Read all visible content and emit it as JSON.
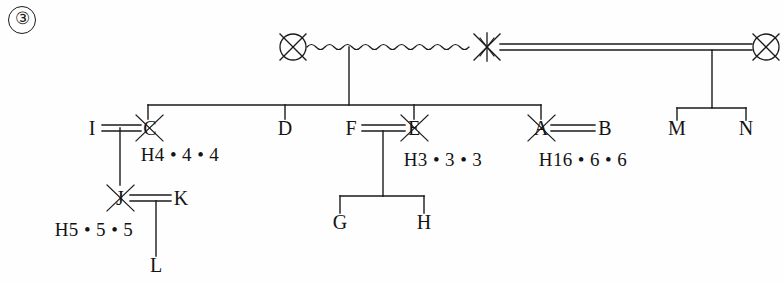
{
  "figure": {
    "number": "③",
    "caption_number": "3",
    "background_color": "#fefefe",
    "line_color": "#1a1a1a",
    "text_color": "#141414",
    "width": 783,
    "height": 283
  },
  "persons": [
    {
      "id": "p-top-left",
      "label": "",
      "x": 293,
      "y": 47,
      "symbol": "circle-crossed",
      "deceased": true,
      "label_dx": 0,
      "label_dy": 0
    },
    {
      "id": "p-top-mid",
      "label": "",
      "x": 487,
      "y": 47,
      "symbol": "cross-only",
      "deceased": true,
      "label_dx": 0,
      "label_dy": 0
    },
    {
      "id": "p-top-right",
      "label": "",
      "x": 766,
      "y": 47,
      "symbol": "circle-crossed",
      "deceased": true,
      "label_dx": 0,
      "label_dy": 0
    },
    {
      "id": "p-I",
      "label": "I",
      "x": 92,
      "y": 128,
      "symbol": "text",
      "deceased": false
    },
    {
      "id": "p-C",
      "label": "C",
      "x": 150,
      "y": 128,
      "symbol": "text-crossed",
      "deceased": true
    },
    {
      "id": "p-D",
      "label": "D",
      "x": 285,
      "y": 128,
      "symbol": "text",
      "deceased": false
    },
    {
      "id": "p-F",
      "label": "F",
      "x": 351,
      "y": 128,
      "symbol": "text",
      "deceased": false
    },
    {
      "id": "p-E",
      "label": "E",
      "x": 414,
      "y": 128,
      "symbol": "text-crossed",
      "deceased": true
    },
    {
      "id": "p-A",
      "label": "A",
      "x": 541,
      "y": 128,
      "symbol": "text-crossed",
      "deceased": true
    },
    {
      "id": "p-B",
      "label": "B",
      "x": 605,
      "y": 128,
      "symbol": "text",
      "deceased": false
    },
    {
      "id": "p-M",
      "label": "M",
      "x": 677,
      "y": 128,
      "symbol": "text",
      "deceased": false
    },
    {
      "id": "p-N",
      "label": "N",
      "x": 746,
      "y": 128,
      "symbol": "text",
      "deceased": false
    },
    {
      "id": "p-J",
      "label": "J",
      "x": 120,
      "y": 198,
      "symbol": "text-crossed",
      "deceased": true
    },
    {
      "id": "p-K",
      "label": "K",
      "x": 181,
      "y": 198,
      "symbol": "text",
      "deceased": false
    },
    {
      "id": "p-G",
      "label": "G",
      "x": 340,
      "y": 222,
      "symbol": "text",
      "deceased": false
    },
    {
      "id": "p-H",
      "label": "H",
      "x": 424,
      "y": 222,
      "symbol": "text",
      "deceased": false
    },
    {
      "id": "p-L",
      "label": "L",
      "x": 156,
      "y": 265,
      "symbol": "text",
      "deceased": false
    }
  ],
  "haplotypes": [
    {
      "id": "hap-C",
      "text": "H4 • 4 • 4",
      "x": 180,
      "y": 154
    },
    {
      "id": "hap-E",
      "text": "H3 • 3 • 3",
      "x": 443,
      "y": 159
    },
    {
      "id": "hap-A",
      "text": "H16 • 6 • 6",
      "x": 583,
      "y": 159
    },
    {
      "id": "hap-J",
      "text": "H5 • 5 • 5",
      "x": 94,
      "y": 229
    }
  ],
  "relationships": [
    {
      "id": "rel-wavy",
      "type": "wavy-union",
      "from": "p-top-left",
      "to": "p-top-mid"
    },
    {
      "id": "rel-double1",
      "type": "double-union",
      "from": "p-top-mid",
      "to": "p-top-right"
    },
    {
      "id": "rel-I-C",
      "type": "double-union",
      "from": "p-I",
      "to": "p-C"
    },
    {
      "id": "rel-F-E",
      "type": "double-union",
      "from": "p-F",
      "to": "p-E"
    },
    {
      "id": "rel-A-B",
      "type": "double-union",
      "from": "p-A",
      "to": "p-B"
    },
    {
      "id": "rel-J-K",
      "type": "double-union",
      "from": "p-J",
      "to": "p-K"
    }
  ],
  "sibships": [
    {
      "id": "sib-main",
      "children": [
        "p-C",
        "p-D",
        "p-F",
        "p-E",
        "p-A"
      ],
      "bar_y": 105
    },
    {
      "id": "sib-right",
      "children": [
        "p-M",
        "p-N"
      ],
      "bar_y": 108
    },
    {
      "id": "sib-GH",
      "children": [
        "p-G",
        "p-H"
      ],
      "bar_y": 196
    },
    {
      "id": "sib-L",
      "children": [
        "p-L"
      ],
      "bar_y": 213
    }
  ],
  "legend": {
    "crossed_meaning": "deceased",
    "double_line_meaning": "consanguineous-union",
    "wavy_line_meaning": "non-standard-union"
  }
}
